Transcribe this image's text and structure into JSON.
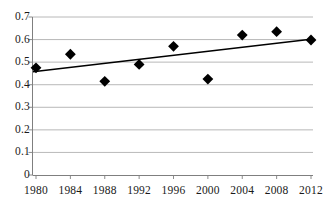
{
  "chart_data": {
    "type": "scatter",
    "title": "",
    "subtitle": "",
    "xlabel": "",
    "ylabel": "",
    "categories": [
      "1980",
      "1984",
      "1988",
      "1992",
      "1996",
      "2000",
      "2004",
      "2008",
      "2012"
    ],
    "x": [
      1980,
      1984,
      1988,
      1992,
      1996,
      2000,
      2004,
      2008,
      2012
    ],
    "values": [
      0.475,
      0.535,
      0.415,
      0.49,
      0.57,
      0.425,
      0.62,
      0.635,
      0.598
    ],
    "series": [
      {
        "name": "data-points",
        "marker": "diamond",
        "color": "#000000",
        "values": [
          0.475,
          0.535,
          0.415,
          0.49,
          0.57,
          0.425,
          0.62,
          0.635,
          0.598
        ]
      },
      {
        "name": "trendline",
        "type": "line",
        "color": "#000000",
        "endpoints": [
          0.457,
          0.603
        ]
      }
    ],
    "ylim": [
      0,
      0.7
    ],
    "ytick_values": [
      0,
      0.1,
      0.2,
      0.3,
      0.4,
      0.5,
      0.6,
      0.7
    ],
    "ytick_labels": [
      "0",
      "0.1",
      "0.2",
      "0.3",
      "0.4",
      "0.5",
      "0.6",
      "0.7"
    ],
    "xtick_labels": [
      "1980",
      "1984",
      "1988",
      "1992",
      "1996",
      "2000",
      "2004",
      "2008",
      "2012"
    ],
    "grid": "horizontal",
    "legend": "none",
    "colors": {
      "marker": "#000000",
      "trendline": "#000000",
      "gridline": "#a6a6a6",
      "axis": "#7f7f7f",
      "text": "#1a1a1a",
      "background": "#ffffff"
    }
  }
}
